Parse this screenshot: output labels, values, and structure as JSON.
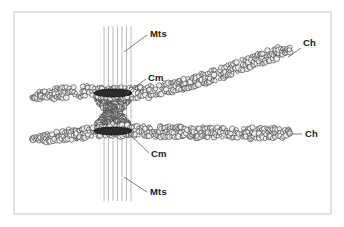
{
  "figure": {
    "kind": "biology-diagram",
    "background_color": "#ffffff",
    "frame": {
      "x": 14,
      "y": 12,
      "width": 317,
      "height": 202,
      "stroke_color": "#c9c9c9"
    },
    "labels": [
      {
        "id": "mts-top",
        "text": "Mts",
        "x": 150,
        "y": 37,
        "leader": {
          "x1": 147,
          "y1": 35,
          "x2": 124,
          "y2": 52
        }
      },
      {
        "id": "cm-top",
        "text": "Cm",
        "x": 148,
        "y": 81,
        "leader": {
          "x1": 146,
          "y1": 79,
          "x2": 127,
          "y2": 93
        }
      },
      {
        "id": "ch-top",
        "text": "Ch",
        "x": 303,
        "y": 46,
        "leader": {
          "x1": 301,
          "y1": 48,
          "x2": 288,
          "y2": 57
        }
      },
      {
        "id": "cm-bottom",
        "text": "Cm",
        "x": 151,
        "y": 157,
        "leader": {
          "x1": 149,
          "y1": 153,
          "x2": 127,
          "y2": 132
        }
      },
      {
        "id": "ch-bottom",
        "text": "Ch",
        "x": 305,
        "y": 137,
        "leader": {
          "x1": 302,
          "y1": 134,
          "x2": 289,
          "y2": 134
        }
      },
      {
        "id": "mts-bottom",
        "text": "Mts",
        "x": 150,
        "y": 195,
        "leader": {
          "x1": 147,
          "y1": 192,
          "x2": 124,
          "y2": 177
        }
      }
    ],
    "legend_terms": [
      {
        "abbr": "Mts",
        "meaning": "Microtubules"
      },
      {
        "abbr": "Cm",
        "meaning": "Centromere"
      },
      {
        "abbr": "Ch",
        "meaning": "Chromatid"
      }
    ],
    "microtubules": {
      "count": 7,
      "x_positions": [
        104,
        108.5,
        113,
        117.5,
        122,
        126.5,
        131
      ],
      "y_top": 26,
      "y_bottom": 201,
      "color": "#b6b6b6"
    },
    "centromere_bands": [
      {
        "id": "cm-band-upper",
        "cx": 113,
        "cy": 93,
        "width": 38,
        "height": 8,
        "color": "#2b2b2b"
      },
      {
        "id": "cm-band-lower",
        "cx": 113,
        "cy": 131,
        "width": 38,
        "height": 8,
        "color": "#2b2b2b"
      }
    ],
    "chromatids": [
      {
        "id": "chromatid-upper",
        "label": "Ch",
        "description": "upper sister chromatid, curving upward to the right",
        "path": "M 32,97 C 56,92 82,90 100,93 L 130,93 C 165,92 210,78 245,64 C 265,56 280,52 290,50",
        "thickness": 13
      },
      {
        "id": "chromatid-lower",
        "label": "Ch",
        "description": "lower sister chromatid, running nearly horizontal to the right",
        "path": "M 32,139 C 56,137 82,134 100,131 L 130,131 C 170,132 215,133 250,133 C 268,133 280,133 290,133",
        "thickness": 13
      }
    ],
    "beads": {
      "fill": "#efefef",
      "stroke": "#2a2a2a",
      "description": "granular chromatin beads rendered as overlapping small circles"
    }
  }
}
